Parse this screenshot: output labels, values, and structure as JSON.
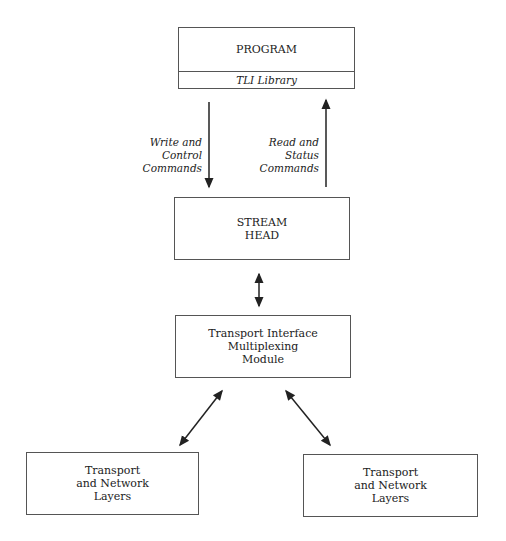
{
  "diagram": {
    "program_box": {
      "title": "PROGRAM",
      "library": "TLI Library"
    },
    "write_label": "Write and\nControl\nCommands",
    "read_label": "Read and\nStatus\nCommands",
    "stream_head": "STREAM\nHEAD",
    "timm": "Transport Interface\nMultiplexing\nModule",
    "left_layers": "Transport\nand Network\nLayers",
    "right_layers": "Transport\nand Network\nLayers"
  }
}
